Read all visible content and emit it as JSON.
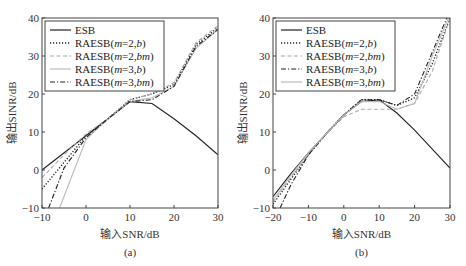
{
  "chart_data": [
    {
      "type": "line",
      "panel_label": "(a)",
      "xlabel": "输入SNR/dB",
      "ylabel": "输出SINR/dB",
      "xlim": [
        -10,
        30
      ],
      "ylim": [
        -10,
        40
      ],
      "xticks": [
        -10,
        0,
        10,
        20,
        30
      ],
      "yticks": [
        -10,
        0,
        10,
        20,
        30,
        40
      ],
      "grid": false,
      "legend_position": "upper left",
      "series": [
        {
          "name": "ESB",
          "style": "solid",
          "color": "#222222",
          "x": [
            -10,
            0,
            5,
            10,
            15,
            20,
            25,
            30
          ],
          "y": [
            0,
            9,
            13.5,
            18,
            17.5,
            13.5,
            9,
            4
          ]
        },
        {
          "name": "RAESB(m=2,b)",
          "style": "dotted",
          "color": "#222222",
          "x": [
            -10,
            -5,
            0,
            5,
            10,
            15,
            20,
            25,
            30
          ],
          "y": [
            -5,
            2,
            9,
            13.5,
            18.5,
            20,
            22.5,
            33,
            37.5
          ]
        },
        {
          "name": "RAESB(m=2,bm)",
          "style": "dashed",
          "color": "#aaaaaa",
          "x": [
            -10,
            -5,
            0,
            5,
            10,
            15,
            20,
            25,
            30
          ],
          "y": [
            -2,
            4,
            9.5,
            13.5,
            18.5,
            20,
            23,
            33.5,
            38
          ]
        },
        {
          "name": "RAESB(m=3,b)",
          "style": "solid",
          "color": "#bbbbbb",
          "x": [
            -6,
            -3,
            0,
            5,
            10,
            15,
            20,
            25,
            30
          ],
          "y": [
            -10,
            -1,
            8,
            13.5,
            18,
            19,
            22,
            32,
            37
          ]
        },
        {
          "name": "RAESB(m=3,bm)",
          "style": "dashdot",
          "color": "#222222",
          "x": [
            -8.5,
            -5,
            0,
            5,
            10,
            15,
            20,
            25,
            30
          ],
          "y": [
            -10,
            0.5,
            8.5,
            13.5,
            18,
            18.5,
            22,
            32.5,
            37
          ]
        }
      ]
    },
    {
      "type": "line",
      "panel_label": "(b)",
      "xlabel": "输入SNR/dB",
      "ylabel": "输出SINR/dB",
      "xlim": [
        -20,
        30
      ],
      "ylim": [
        -10,
        40
      ],
      "xticks": [
        -20,
        -10,
        0,
        10,
        20,
        30
      ],
      "yticks": [
        -10,
        0,
        10,
        20,
        30,
        40
      ],
      "grid": false,
      "legend_position": "upper left",
      "series": [
        {
          "name": "ESB",
          "style": "solid",
          "color": "#222222",
          "x": [
            -20,
            -15,
            -10,
            -5,
            0,
            5,
            10,
            15,
            20,
            25,
            30
          ],
          "y": [
            -7,
            -1,
            4.5,
            9.5,
            14.5,
            18,
            18.5,
            15,
            10.5,
            5.5,
            0.5
          ]
        },
        {
          "name": "RAESB(m=2,b)",
          "style": "dotted",
          "color": "#222222",
          "x": [
            -20,
            -15,
            -10,
            -5,
            0,
            5,
            10,
            15,
            20,
            25,
            30
          ],
          "y": [
            -9,
            -2.5,
            4,
            9.5,
            14.5,
            18.5,
            18.5,
            17,
            19,
            28,
            40
          ]
        },
        {
          "name": "RAESB(m=2,bm)",
          "style": "dashed",
          "color": "#aaaaaa",
          "x": [
            -20,
            -15,
            -10,
            -5,
            0,
            5,
            10,
            15,
            20,
            25,
            30
          ],
          "y": [
            -8.5,
            -2,
            4,
            9.5,
            14,
            16,
            16,
            16,
            17.5,
            26,
            40
          ]
        },
        {
          "name": "RAESB(m=3,b)",
          "style": "dashdot",
          "color": "#222222",
          "x": [
            -18,
            -15,
            -10,
            -5,
            0,
            5,
            10,
            15,
            20,
            25,
            30
          ],
          "y": [
            -10,
            -4,
            4,
            9.5,
            14.5,
            18.5,
            18.5,
            17,
            20,
            31,
            42
          ]
        },
        {
          "name": "RAESB(m=3,bm)",
          "style": "solid",
          "color": "#bbbbbb",
          "x": [
            -20,
            -15,
            -10,
            -5,
            0,
            5,
            10,
            15,
            20,
            25,
            30
          ],
          "y": [
            -8,
            -1.5,
            4.5,
            9.5,
            14.5,
            18,
            18,
            16,
            17.5,
            30,
            41
          ]
        }
      ]
    }
  ]
}
